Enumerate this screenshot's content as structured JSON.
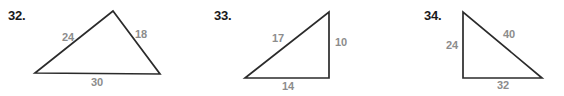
{
  "page": {
    "background_color": "#ffffff",
    "stroke_color": "#2b2b2b",
    "label_color": "#8c8c8c",
    "number_color": "#1a1a1a"
  },
  "problems": [
    {
      "number": "32.",
      "number_x": 8,
      "number_y": 8,
      "shape": "scalene-triangle",
      "points": "35,73 113,11 160,74",
      "labels": [
        {
          "text": "24",
          "x": 68,
          "y": 37,
          "side": "left"
        },
        {
          "text": "18",
          "x": 141,
          "y": 34,
          "side": "right"
        },
        {
          "text": "30",
          "x": 97,
          "y": 82,
          "side": "base"
        }
      ]
    },
    {
      "number": "33.",
      "number_x": 214,
      "number_y": 8,
      "shape": "right-triangle",
      "points": "245,78 329,12 329,78",
      "labels": [
        {
          "text": "17",
          "x": 278,
          "y": 38,
          "side": "hypotenuse"
        },
        {
          "text": "10",
          "x": 341,
          "y": 42,
          "side": "vertical"
        },
        {
          "text": "14",
          "x": 288,
          "y": 86,
          "side": "base"
        }
      ]
    },
    {
      "number": "34.",
      "number_x": 424,
      "number_y": 8,
      "shape": "right-triangle",
      "points": "463,12 463,78 542,78",
      "labels": [
        {
          "text": "24",
          "x": 452,
          "y": 45,
          "side": "vertical"
        },
        {
          "text": "40",
          "x": 509,
          "y": 34,
          "side": "hypotenuse"
        },
        {
          "text": "32",
          "x": 503,
          "y": 85,
          "side": "base"
        }
      ]
    }
  ]
}
